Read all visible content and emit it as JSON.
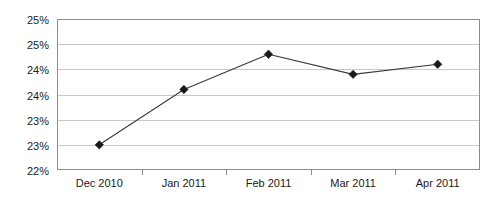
{
  "chart_data": {
    "type": "line",
    "title": "",
    "subtitle": "",
    "xlabel": "",
    "ylabel": "",
    "categories": [
      "Dec 2010",
      "Jan 2011",
      "Feb 2011",
      "Mar 2011",
      "Apr 2011"
    ],
    "series": [
      {
        "name": "",
        "values": [
          23.0,
          24.1,
          24.8,
          24.4,
          24.6
        ]
      }
    ],
    "ylim": [
      22.5,
      25.5
    ],
    "ytick_values": [
      25.5,
      25.0,
      24.5,
      24.0,
      23.5,
      23.0,
      22.5
    ],
    "ytick_labels": [
      "25%",
      "25%",
      "24%",
      "24%",
      "23%",
      "23%",
      "22%"
    ],
    "xtick_labels": [
      "Dec 2010",
      "Jan 2011",
      "Feb 2011",
      "Mar 2011",
      "Apr 2011"
    ],
    "grid": true,
    "grid_axis": "y",
    "legend": false,
    "legend_position": "none",
    "marker": "diamond",
    "value_format": "percent",
    "annotations": []
  },
  "style": {
    "background": "#ffffff",
    "grid_color": "#c9c9c9",
    "border_color": "#8c8c8c",
    "line_color": "#3a3a3a",
    "marker_color": "#1a1a1a",
    "text_color": "#1a1a1a"
  },
  "geometry": {
    "plot_left": 57,
    "plot_right": 480,
    "plot_top": 19,
    "plot_bottom": 170
  }
}
